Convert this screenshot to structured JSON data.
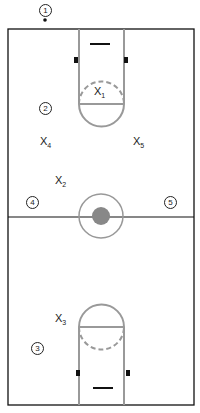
{
  "diagram": {
    "offense": [
      {
        "id": "1",
        "label": "1",
        "x": 37,
        "y": 4
      },
      {
        "id": "2",
        "label": "2",
        "x": 39,
        "y": 103
      },
      {
        "id": "3",
        "label": "3",
        "x": 31,
        "y": 343
      },
      {
        "id": "4",
        "label": "4",
        "x": 26,
        "y": 197
      },
      {
        "id": "5",
        "label": "5",
        "x": 164,
        "y": 197
      }
    ],
    "defense": [
      {
        "id": "X1",
        "base": "X",
        "sub": "1",
        "x": 93,
        "y": 87
      },
      {
        "id": "X2",
        "base": "X",
        "sub": "2",
        "x": 55,
        "y": 175
      },
      {
        "id": "X3",
        "base": "X",
        "sub": "3",
        "x": 55,
        "y": 313
      },
      {
        "id": "X4",
        "base": "X",
        "sub": "4",
        "x": 40,
        "y": 137
      },
      {
        "id": "X5",
        "base": "X",
        "sub": "5",
        "x": 133,
        "y": 137
      }
    ]
  }
}
